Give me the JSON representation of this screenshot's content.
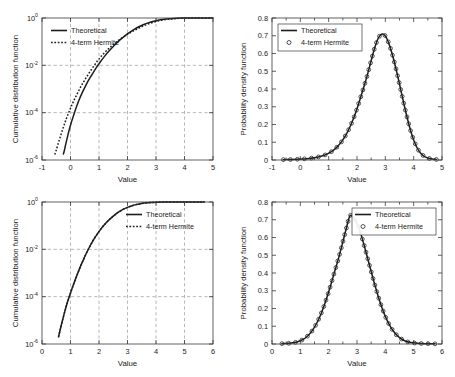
{
  "figure": {
    "axis_titles": {
      "x_value": "Value",
      "y_cdf": "Cumulative distribution function",
      "y_pdf": "Probability density function"
    },
    "legend": {
      "theoretical": "Theoretical",
      "hermite": "4-term Hermite"
    },
    "colors": {
      "curve": "#1d1d1d",
      "grid": "#9a9a9a",
      "frame": "#3a3a3a",
      "background": "#ffffff"
    }
  },
  "chart_data": [
    {
      "id": "cdf-top-left",
      "type": "line",
      "title": "",
      "xlabel": "Value",
      "ylabel": "Cumulative distribution function",
      "yscale": "log",
      "xlim": [
        -1,
        5
      ],
      "ylim": [
        1e-06,
        1
      ],
      "grid": true,
      "legend_position": "upper-left",
      "xticks": [
        -1,
        0,
        1,
        2,
        3,
        4,
        5
      ],
      "xticklabels": [
        "-1",
        "0",
        "1",
        "2",
        "3",
        "4",
        "5"
      ],
      "yticks": [
        1,
        0.01,
        0.0001,
        1e-06
      ],
      "yticklabels": [
        "10^0",
        "10^-2",
        "10^-4",
        "10^-6"
      ],
      "distribution": {
        "mean": 2.62,
        "sigma": 0.62,
        "skew": -0.62
      },
      "series": [
        {
          "name": "Theoretical",
          "style": "solid",
          "x": [
            -0.25,
            -0.22,
            -0.18,
            -0.12,
            -0.05,
            0.02,
            0.08,
            0.15,
            0.22,
            0.3,
            0.4,
            0.5,
            0.62,
            0.75,
            0.9,
            1.05,
            1.2,
            1.35,
            1.5,
            1.65,
            1.8,
            1.95,
            2.1,
            2.25,
            2.4,
            2.55,
            2.7,
            2.85,
            3.0,
            3.15,
            3.3,
            3.45,
            3.6,
            3.75,
            3.9,
            4.1,
            4.3,
            4.6,
            5.0
          ],
          "y": [
            1.8e-06,
            2.4e-06,
            4e-06,
            8e-06,
            1.8e-05,
            3.6e-05,
            6e-05,
            0.00011,
            0.00019,
            0.00034,
            0.00065,
            0.00115,
            0.0022,
            0.004,
            0.0078,
            0.0142,
            0.0245,
            0.04,
            0.063,
            0.095,
            0.138,
            0.193,
            0.26,
            0.338,
            0.425,
            0.516,
            0.607,
            0.694,
            0.772,
            0.838,
            0.89,
            0.93,
            0.958,
            0.976,
            0.988,
            0.996,
            0.999,
            0.9999,
            1.0
          ]
        },
        {
          "name": "4-term Hermite",
          "style": "dotted",
          "x": [
            -0.55,
            -0.5,
            -0.44,
            -0.37,
            -0.3,
            -0.22,
            -0.14,
            -0.05,
            0.04,
            0.14,
            0.25,
            0.37,
            0.5,
            0.64,
            0.79,
            0.95,
            1.1,
            1.28,
            1.45,
            1.62,
            1.8,
            1.97,
            2.14,
            2.3,
            2.46,
            2.62,
            2.78,
            2.94,
            3.1,
            3.26,
            3.42,
            3.58,
            3.75,
            3.92,
            4.12,
            4.35,
            4.65,
            5.0
          ],
          "y": [
            1.7e-06,
            2.6e-06,
            4.6e-06,
            8.5e-06,
            1.6e-05,
            3.1e-05,
            5.8e-05,
            0.00011,
            0.0002,
            0.00037,
            0.00068,
            0.0013,
            0.0024,
            0.0045,
            0.0084,
            0.0155,
            0.0258,
            0.0435,
            0.067,
            0.099,
            0.142,
            0.194,
            0.256,
            0.326,
            0.41,
            0.5,
            0.592,
            0.68,
            0.76,
            0.83,
            0.884,
            0.926,
            0.958,
            0.978,
            0.99,
            0.997,
            0.9999,
            1.0
          ]
        }
      ]
    },
    {
      "id": "pdf-top-right",
      "type": "line",
      "title": "",
      "xlabel": "Value",
      "ylabel": "Probability density function",
      "yscale": "linear",
      "xlim": [
        -1,
        5
      ],
      "ylim": [
        0,
        0.8
      ],
      "grid": false,
      "legend_position": "upper-left",
      "xticks": [
        -1,
        0,
        1,
        2,
        3,
        4,
        5
      ],
      "xticklabels": [
        "-1",
        "0",
        "1",
        "2",
        "3",
        "4",
        "5"
      ],
      "yticks": [
        0,
        0.1,
        0.2,
        0.3,
        0.4,
        0.5,
        0.6,
        0.7,
        0.8
      ],
      "yticklabels": [
        "0",
        "0.1",
        "0.2",
        "0.3",
        "0.4",
        "0.5",
        "0.6",
        "0.7",
        "0.8"
      ],
      "peak": {
        "x": 2.9,
        "y": 0.71
      },
      "distribution": {
        "mode": 2.9,
        "sigma_left": 0.78,
        "sigma_right": 0.45
      },
      "marker_count": 46,
      "series": [
        {
          "name": "Theoretical",
          "style": "solid",
          "x": [
            -0.6,
            -0.3,
            0.0,
            0.3,
            0.6,
            0.85,
            1.0,
            1.15,
            1.3,
            1.45,
            1.6,
            1.75,
            1.9,
            2.05,
            2.2,
            2.35,
            2.5,
            2.62,
            2.74,
            2.84,
            2.9,
            2.98,
            3.06,
            3.16,
            3.28,
            3.4,
            3.52,
            3.64,
            3.76,
            3.88,
            4.0,
            4.12,
            4.24,
            4.4,
            4.6,
            4.8
          ],
          "y": [
            0.002,
            0.003,
            0.005,
            0.009,
            0.016,
            0.027,
            0.038,
            0.053,
            0.074,
            0.102,
            0.139,
            0.186,
            0.244,
            0.313,
            0.39,
            0.47,
            0.56,
            0.63,
            0.683,
            0.706,
            0.71,
            0.703,
            0.682,
            0.64,
            0.575,
            0.498,
            0.413,
            0.327,
            0.245,
            0.172,
            0.113,
            0.069,
            0.04,
            0.018,
            0.007,
            0.003
          ]
        },
        {
          "name": "4-term Hermite",
          "style": "markers",
          "marker": "circle"
        }
      ]
    },
    {
      "id": "cdf-bottom-left",
      "type": "line",
      "title": "",
      "xlabel": "Value",
      "ylabel": "Cumulative distribution function",
      "yscale": "log",
      "xlim": [
        0,
        6
      ],
      "ylim": [
        1e-06,
        1
      ],
      "grid": true,
      "legend_position": "upper-right",
      "xticks": [
        0,
        1,
        2,
        3,
        4,
        5,
        6
      ],
      "xticklabels": [
        "0",
        "1",
        "2",
        "3",
        "4",
        "5",
        "6"
      ],
      "yticks": [
        1,
        0.01,
        0.0001,
        1e-06
      ],
      "yticklabels": [
        "10^0",
        "10^-2",
        "10^-4",
        "10^-6"
      ],
      "distribution": {
        "mean": 2.78,
        "sigma": 0.58,
        "skew": 0.1
      },
      "series": [
        {
          "name": "Theoretical",
          "style": "solid",
          "x": [
            0.58,
            0.62,
            0.68,
            0.75,
            0.82,
            0.9,
            0.98,
            1.06,
            1.15,
            1.25,
            1.35,
            1.45,
            1.56,
            1.68,
            1.8,
            1.92,
            2.05,
            2.18,
            2.32,
            2.46,
            2.6,
            2.74,
            2.88,
            3.02,
            3.16,
            3.3,
            3.45,
            3.6,
            3.8,
            4.0,
            4.3,
            4.7,
            5.1,
            5.7
          ],
          "y": [
            2e-06,
            3.2e-06,
            6.5e-06,
            1.4e-05,
            2.9e-05,
            6.2e-05,
            0.00012,
            0.00023,
            0.00046,
            0.00095,
            0.0019,
            0.0036,
            0.007,
            0.0135,
            0.0245,
            0.041,
            0.068,
            0.106,
            0.16,
            0.23,
            0.315,
            0.41,
            0.51,
            0.608,
            0.698,
            0.775,
            0.845,
            0.898,
            0.95,
            0.978,
            0.994,
            0.9994,
            0.9999,
            1.0
          ]
        },
        {
          "name": "4-term Hermite",
          "style": "dotted-overlay",
          "note": "coincident with theoretical"
        }
      ]
    },
    {
      "id": "pdf-bottom-right",
      "type": "line",
      "title": "",
      "xlabel": "Value",
      "ylabel": "Probability density function",
      "yscale": "linear",
      "xlim": [
        0,
        6
      ],
      "ylim": [
        0,
        0.8
      ],
      "grid": false,
      "legend_position": "upper-right",
      "xticks": [
        0,
        1,
        2,
        3,
        4,
        5,
        6
      ],
      "xticklabels": [
        "0",
        "1",
        "2",
        "3",
        "4",
        "5",
        "6"
      ],
      "yticks": [
        0,
        0.1,
        0.2,
        0.3,
        0.4,
        0.5,
        0.6,
        0.7,
        0.8
      ],
      "yticklabels": [
        "0",
        "0.1",
        "0.2",
        "0.3",
        "0.4",
        "0.5",
        "0.6",
        "0.7",
        "0.8"
      ],
      "peak": {
        "x": 2.75,
        "y": 0.725
      },
      "distribution": {
        "mode": 2.75,
        "sigma_left": 0.55,
        "sigma_right": 0.58
      },
      "marker_count": 48,
      "series": [
        {
          "name": "Theoretical",
          "style": "solid",
          "x": [
            0.35,
            0.6,
            0.85,
            1.0,
            1.15,
            1.3,
            1.45,
            1.6,
            1.75,
            1.9,
            2.05,
            2.2,
            2.35,
            2.5,
            2.62,
            2.75,
            2.88,
            3.0,
            3.15,
            3.3,
            3.45,
            3.6,
            3.75,
            3.9,
            4.05,
            4.2,
            4.35,
            4.5,
            4.7,
            4.9,
            5.15,
            5.45,
            5.75
          ],
          "y": [
            0.002,
            0.004,
            0.01,
            0.018,
            0.031,
            0.052,
            0.082,
            0.124,
            0.178,
            0.244,
            0.32,
            0.402,
            0.484,
            0.575,
            0.65,
            0.722,
            0.712,
            0.68,
            0.612,
            0.528,
            0.438,
            0.35,
            0.268,
            0.196,
            0.137,
            0.092,
            0.059,
            0.036,
            0.017,
            0.008,
            0.004,
            0.002,
            0.001
          ]
        },
        {
          "name": "4-term Hermite",
          "style": "markers",
          "marker": "circle"
        }
      ]
    }
  ]
}
